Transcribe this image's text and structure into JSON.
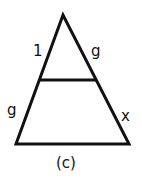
{
  "figure": {
    "caption": "(c)",
    "labels": {
      "upper_left_side": "1",
      "upper_right_side": "g",
      "lower_left_side": "g",
      "lower_right_side": "x"
    },
    "stroke_color": "#111111"
  }
}
